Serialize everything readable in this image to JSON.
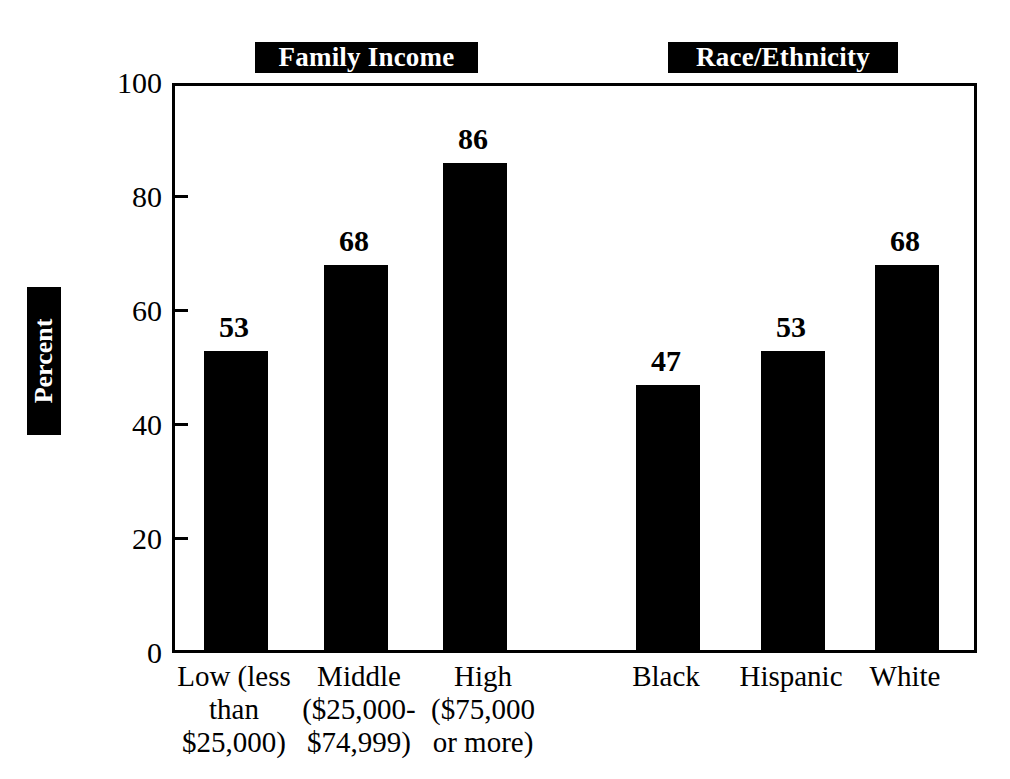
{
  "chart_data": {
    "type": "bar",
    "title": "",
    "xlabel": "",
    "ylabel": "Percent",
    "ylim": [
      0,
      100
    ],
    "yticks": [
      0,
      20,
      40,
      60,
      80,
      100
    ],
    "grid": false,
    "legend": "none",
    "orientation": "vertical",
    "bar_color": "#000000",
    "groups": [
      {
        "name": "Family Income",
        "categories": [
          "Low (less\nthan\n$25,000)",
          "Middle\n($25,000-\n$74,999)",
          "High\n($75,000\nor more)"
        ],
        "values": [
          53,
          68,
          86
        ]
      },
      {
        "name": "Race/Ethnicity",
        "categories": [
          "Black",
          "Hispanic",
          "White"
        ],
        "values": [
          47,
          53,
          68
        ]
      }
    ],
    "categories": [
      "Low (less than $25,000)",
      "Middle ($25,000-$74,999)",
      "High ($75,000 or more)",
      "Black",
      "Hispanic",
      "White"
    ],
    "values": [
      53,
      68,
      86,
      47,
      53,
      68
    ]
  },
  "banners": {
    "income": "Family Income",
    "race": "Race/Ethnicity"
  },
  "axis": {
    "y_title": "Percent",
    "y_tick_labels": [
      "100",
      "80",
      "60",
      "40",
      "20",
      "0"
    ]
  },
  "bars": [
    {
      "key": "low-income",
      "value_label": "53",
      "lines": [
        "Low (less",
        "than",
        "$25,000)"
      ]
    },
    {
      "key": "middle-income",
      "value_label": "68",
      "lines": [
        "Middle",
        "($25,000-",
        "$74,999)"
      ]
    },
    {
      "key": "high-income",
      "value_label": "86",
      "lines": [
        "High",
        "($75,000",
        "or more)"
      ]
    },
    {
      "key": "black",
      "value_label": "47",
      "lines": [
        "Black"
      ]
    },
    {
      "key": "hispanic",
      "value_label": "53",
      "lines": [
        "Hispanic"
      ]
    },
    {
      "key": "white",
      "value_label": "68",
      "lines": [
        "White"
      ]
    }
  ]
}
